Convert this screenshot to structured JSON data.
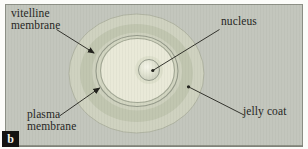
{
  "figure": {
    "panel_label": "b",
    "labels": {
      "vitelline_membrane": {
        "line1": "vitelline",
        "line2": "membrane"
      },
      "nucleus": {
        "text": "nucleus"
      },
      "plasma_membrane": {
        "line1": "plasma",
        "line2": "membrane"
      },
      "jelly_coat": {
        "text": "jelly coat"
      }
    },
    "colors": {
      "panel_background": "#c3c6bd",
      "panel_border": "#8d9086",
      "panel_bottom_edge": "#7c7f74",
      "jelly_coat_outer": "#cfd2c0",
      "jelly_coat_outer_edge": "#a8ac9b",
      "jelly_coat_inner": "#c1c6b0",
      "perivitelline_space": "#ced1be",
      "vitelline_fill": "#d3d6c2",
      "vitelline_membrane_line": "#959a8a",
      "egg_cytoplasm": "#e9e9d8",
      "plasma_membrane_line": "#a2a794",
      "nucleus_halo": "#dee0cc",
      "nucleus_highlight": "#f5f5ea",
      "nucleus_mid": "#e3e5d4",
      "nucleus_shade": "#c7cbb9",
      "nucleus_outline": "#8f9486",
      "pointer_line": "#21211c",
      "label_text": "#26261f"
    }
  }
}
